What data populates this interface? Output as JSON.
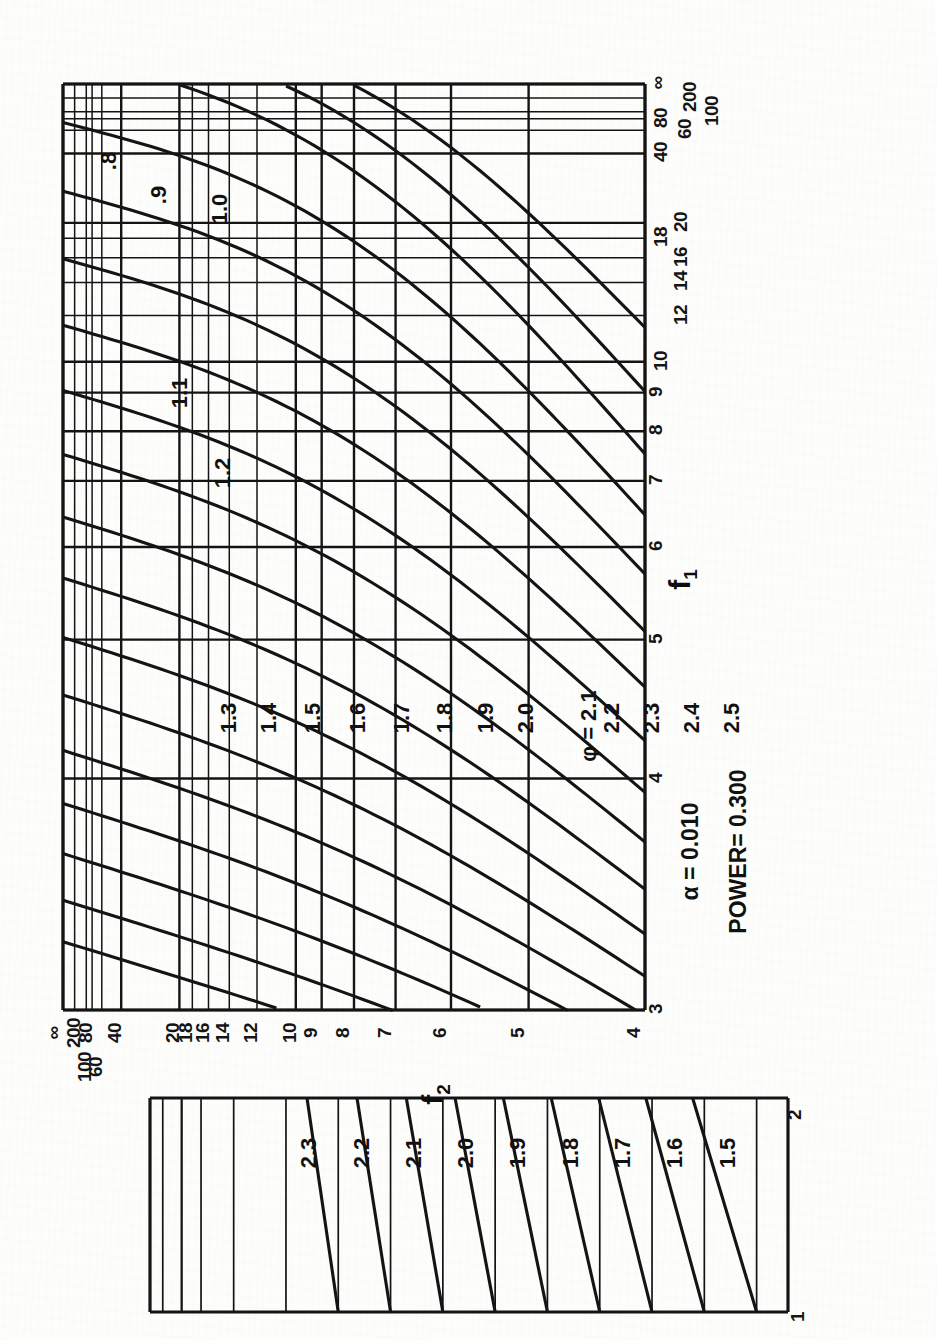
{
  "figure": {
    "orientation": "rotated-90-ccw",
    "annotations": {
      "alpha": "α  = 0.010",
      "power": "POWER= 0.300",
      "phi_label": "φ = 2.1"
    },
    "axis_names": {
      "f1": "f",
      "f1_sub": "1",
      "f2": "f",
      "f2_sub": "2"
    },
    "ink_color": "#141414",
    "paper_color": "#fdfdfc"
  },
  "chart_data": {
    "type": "line",
    "title": "",
    "subtitle": "",
    "xlabel": "f₁",
    "ylabel": "f₂",
    "grid": true,
    "legend_position": "inline-curve-labels",
    "note": "Pearson-Hartley power-function chart (nomogram). Curves are iso-φ contours plotted on reciprocal (1/f) scales for degrees of freedom f1 (abscissa) and f2 (ordinate).",
    "x_axis": {
      "name": "f1",
      "scale": "reciprocal",
      "range": [
        3,
        "∞"
      ],
      "tick_labels": [
        "3",
        "4",
        "5",
        "6",
        "7",
        "8",
        "9",
        "10",
        "12",
        "14",
        "16",
        "18",
        "20",
        "40",
        "60",
        "80",
        "100",
        "200",
        "∞"
      ],
      "tick_values": [
        3,
        4,
        5,
        6,
        7,
        8,
        9,
        10,
        12,
        14,
        16,
        18,
        20,
        40,
        60,
        80,
        100,
        200,
        100000
      ]
    },
    "y_axis": {
      "name": "f2",
      "scale": "reciprocal",
      "range": [
        4,
        "∞"
      ],
      "tick_labels": [
        "4",
        "5",
        "6",
        "7",
        "8",
        "9",
        "10",
        "12",
        "14",
        "16",
        "18",
        "20",
        "40",
        "60",
        "80",
        "100",
        "200",
        "∞"
      ],
      "tick_values": [
        4,
        5,
        6,
        7,
        8,
        9,
        10,
        12,
        14,
        16,
        18,
        20,
        40,
        60,
        80,
        100,
        200,
        100000
      ]
    },
    "series": [
      {
        "name": ".8",
        "phi": 0.8
      },
      {
        "name": ".9",
        "phi": 0.9
      },
      {
        "name": "1.0",
        "phi": 1.0
      },
      {
        "name": "1.1",
        "phi": 1.1
      },
      {
        "name": "1.2",
        "phi": 1.2
      },
      {
        "name": "1.3",
        "phi": 1.3
      },
      {
        "name": "1.4",
        "phi": 1.4
      },
      {
        "name": "1.5",
        "phi": 1.5
      },
      {
        "name": "1.6",
        "phi": 1.6
      },
      {
        "name": "1.7",
        "phi": 1.7
      },
      {
        "name": "1.8",
        "phi": 1.8
      },
      {
        "name": "1.9",
        "phi": 1.9
      },
      {
        "name": "2.0",
        "phi": 2.0
      },
      {
        "name": "2.1",
        "phi": 2.1
      },
      {
        "name": "2.2",
        "phi": 2.2
      },
      {
        "name": "2.3",
        "phi": 2.3
      },
      {
        "name": "2.4",
        "phi": 2.4
      },
      {
        "name": "2.5",
        "phi": 2.5
      }
    ],
    "inset": {
      "type": "line",
      "xlabel": "f₂",
      "x_tick_labels": [
        "1",
        "2"
      ],
      "curve_labels": [
        "1.5",
        "1.6",
        "1.7",
        "1.8",
        "1.9",
        "2.0",
        "2.1",
        "2.2",
        "2.3"
      ]
    }
  },
  "main_panel": {
    "x_ticks": [
      {
        "label": "3"
      },
      {
        "label": "4"
      },
      {
        "label": "5"
      },
      {
        "label": "6"
      },
      {
        "label": "7"
      },
      {
        "label": "8"
      },
      {
        "label": "9"
      },
      {
        "label": "10"
      },
      {
        "label": "12"
      },
      {
        "label": "14"
      },
      {
        "label": "16"
      },
      {
        "label": "18"
      },
      {
        "label": "20"
      },
      {
        "label": "40"
      },
      {
        "label": "60"
      },
      {
        "label": "80"
      },
      {
        "label": "100"
      },
      {
        "label": "200"
      },
      {
        "label": "∞"
      }
    ],
    "x_stack_labels": [
      "40/80",
      "∞/200",
      "100",
      "60"
    ],
    "x_bracket_labels": [
      "|18|",
      "16",
      "20",
      "14",
      "12"
    ],
    "y_ticks": [
      {
        "label": "∞"
      },
      {
        "label": "200"
      },
      {
        "label": "100"
      },
      {
        "label": "80"
      },
      {
        "label": "60"
      },
      {
        "label": "40"
      },
      {
        "label": "20"
      },
      {
        "label": "18"
      },
      {
        "label": "16"
      },
      {
        "label": "14"
      },
      {
        "label": "12"
      },
      {
        "label": "10"
      },
      {
        "label": "9"
      },
      {
        "label": "8"
      },
      {
        "label": "7"
      },
      {
        "label": "6"
      },
      {
        "label": "5"
      },
      {
        "label": "4"
      }
    ],
    "curve_labels": [
      ".8",
      ".9",
      "1.0",
      "1.1",
      "1.2",
      "1.3",
      "1.4",
      "1.5",
      "1.6",
      "1.7",
      "1.8",
      "1.9",
      "2.0",
      "2.1",
      "2.2",
      "2.3",
      "2.4",
      "2.5"
    ]
  },
  "inset_panel": {
    "curve_labels": [
      "1.5",
      "1.6",
      "1.7",
      "1.8",
      "1.9",
      "2.0",
      "2.1",
      "2.2",
      "2.3"
    ],
    "tick_top": "2",
    "tick_bottom": "1"
  }
}
